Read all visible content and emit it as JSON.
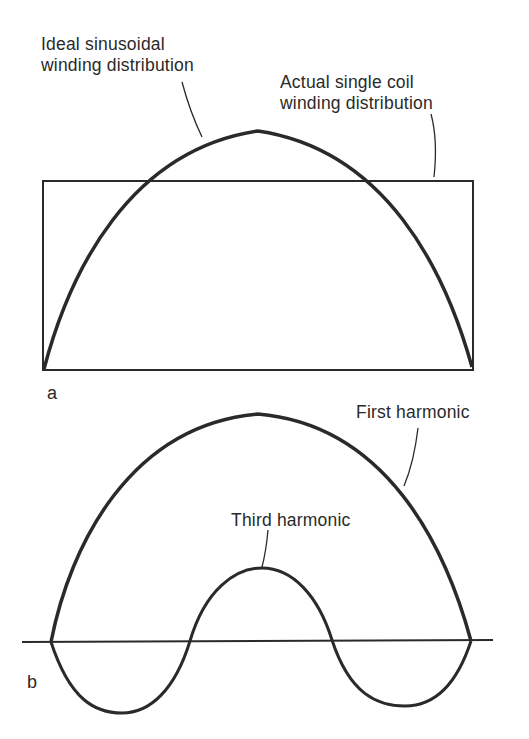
{
  "figure": {
    "panel_a": {
      "panel_label": "a",
      "ideal_label": {
        "line1": "Ideal sinusoidal",
        "line2": "winding distribution"
      },
      "actual_label": {
        "line1": "Actual single coil",
        "line2": "winding distribution"
      },
      "curves": [
        "ideal-sinusoidal-half-wave",
        "rectangular-single-coil-distribution"
      ]
    },
    "panel_b": {
      "panel_label": "b",
      "first_harmonic_label": "First harmonic",
      "third_harmonic_label": "Third harmonic",
      "curves": [
        "first-harmonic-half-wave",
        "third-harmonic-1.5-cycles"
      ]
    },
    "colors": {
      "ink": "#2a2a2a",
      "background": "#ffffff"
    }
  }
}
